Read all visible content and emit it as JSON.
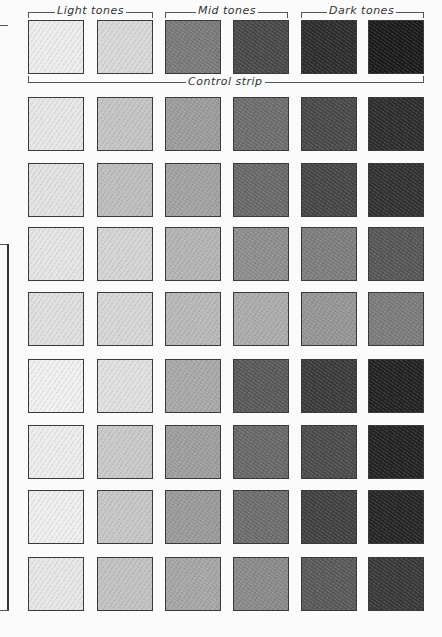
{
  "headers": {
    "light": "Light tones",
    "mid": "Mid tones",
    "dark": "Dark tones",
    "control": "Control strip"
  },
  "rows": [
    {
      "name": "control-strip",
      "tones": [
        "#ececec",
        "#d8d8d8",
        "#7a7a7a",
        "#4a4a4a",
        "#2e2e2e",
        "#1c1c1c"
      ]
    },
    {
      "name": "test-row-1",
      "tones": [
        "#e6e6e6",
        "#c4c4c4",
        "#9c9c9c",
        "#6e6e6e",
        "#4a4a4a",
        "#2e2e2e"
      ]
    },
    {
      "name": "test-row-2",
      "tones": [
        "#e2e2e2",
        "#bdbdbd",
        "#a2a2a2",
        "#6a6a6a",
        "#474747",
        "#333333"
      ]
    },
    {
      "name": "test-row-3",
      "tones": [
        "#e4e4e4",
        "#d4d4d4",
        "#b4b4b4",
        "#8e8e8e",
        "#7e7e7e",
        "#575757"
      ]
    },
    {
      "name": "test-row-4",
      "tones": [
        "#dedede",
        "#d6d6d6",
        "#b8b8b8",
        "#acacac",
        "#969696",
        "#7c7c7c"
      ]
    },
    {
      "name": "test-row-5",
      "tones": [
        "#f0f0f0",
        "#e0e0e0",
        "#a8a8a8",
        "#5a5a5a",
        "#3c3c3c",
        "#232323"
      ]
    },
    {
      "name": "test-row-6",
      "tones": [
        "#ececec",
        "#c8c8c8",
        "#9e9e9e",
        "#696969",
        "#4c4c4c",
        "#242424"
      ]
    },
    {
      "name": "test-row-7",
      "tones": [
        "#eeeeee",
        "#c6c6c6",
        "#9a9a9a",
        "#6e6e6e",
        "#424242",
        "#272727"
      ]
    },
    {
      "name": "test-row-8",
      "tones": [
        "#e6e6e6",
        "#c2c2c2",
        "#a6a6a6",
        "#8a8a8a",
        "#5a5a5a",
        "#3a3a3a"
      ]
    }
  ]
}
